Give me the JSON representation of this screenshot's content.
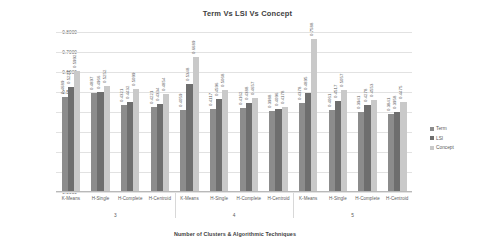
{
  "chart_data": {
    "type": "bar",
    "title": "Term Vs LSI Vs Concept",
    "xlabel": "Number of Clusters & Algorithmic Techniques",
    "ylabel": "Euclidean Distance based FM Index",
    "ylim": [
      0.0,
      0.8
    ],
    "ytick_labels": [
      "0.8000",
      "0.7000",
      "0.6000",
      "0.5000",
      "0.4000",
      "0.3000",
      "0.2000",
      "0.1000",
      "0.0000"
    ],
    "ytick_values": [
      0.8,
      0.7,
      0.6,
      0.5,
      0.4,
      0.3,
      0.2,
      0.1,
      0.0
    ],
    "grid": true,
    "legend_position": "right",
    "categories": [
      "K-Means",
      "H-Single",
      "H-Complete",
      "H-Centroid",
      "K-Means",
      "H-Single",
      "H-Complete",
      "H-Centroid",
      "K-Means",
      "H-Single",
      "H-Complete",
      "H-Centroid"
    ],
    "group_labels": [
      "3",
      "4",
      "5"
    ],
    "group_size": 4,
    "series": [
      {
        "name": "Term",
        "color": "#8c8c8c",
        "values": [
          0.4689,
          0.4897,
          0.4321,
          0.4221,
          0.4059,
          0.4117,
          0.4162,
          0.3988,
          0.4378,
          0.4061,
          0.3941,
          0.3841
        ],
        "labels": [
          "0.4689",
          "0.4897",
          "0.4321",
          "0.4221",
          "0.4059",
          "0.4117",
          "0.4162",
          "0.3988",
          "0.4378",
          "0.4061",
          "0.3941",
          "0.3841"
        ]
      },
      {
        "name": "LSI",
        "color": "#6e6e6e",
        "values": [
          0.5221,
          0.4966,
          0.4432,
          0.4334,
          0.5348,
          0.4596,
          0.4388,
          0.4096,
          0.4895,
          0.4517,
          0.4278,
          0.3958
        ],
        "labels": [
          "0.5221",
          "0.4966",
          "0.4432",
          "0.4334",
          "0.5348",
          "0.4596",
          "0.4388",
          "0.4096",
          "0.4895",
          "0.4517",
          "0.4278",
          "0.3958"
        ]
      },
      {
        "name": "Concept",
        "color": "#c9c9c9",
        "values": [
          0.5992,
          0.5252,
          0.5099,
          0.4854,
          0.6689,
          0.5068,
          0.4657,
          0.4178,
          0.7588,
          0.5057,
          0.4553,
          0.4475
        ],
        "labels": [
          "0.5992",
          "0.5252",
          "0.5099",
          "0.4854",
          "0.6689",
          "0.5068",
          "0.4657",
          "0.4178",
          "0.7588",
          "0.5057",
          "0.4553",
          "0.4475"
        ]
      }
    ]
  }
}
